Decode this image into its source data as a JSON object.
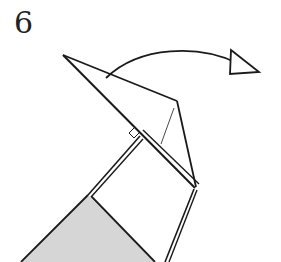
{
  "step": {
    "number": "6"
  },
  "diagram": {
    "colors": {
      "line": "#1a1a1a",
      "paper_back": "#d6d6d6",
      "paper_front": "#ffffff"
    },
    "arrow": {
      "type": "fold-over-arrow",
      "direction": "right"
    },
    "marks": [
      "right-angle-mark"
    ]
  }
}
